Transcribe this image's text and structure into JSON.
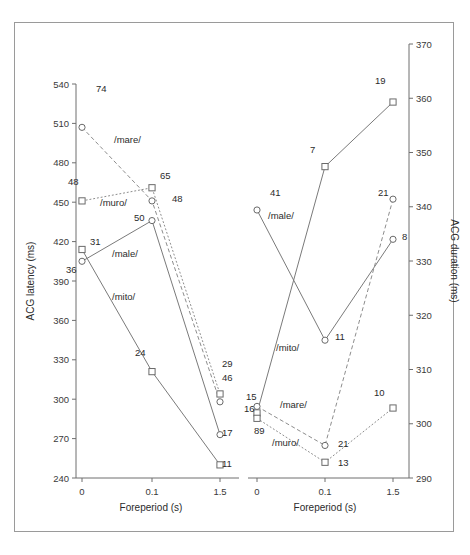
{
  "figure": {
    "background": "#ffffff",
    "frame_color": "#9a9a9a",
    "line_color": "#7a7a7a",
    "marker_edge_color": "#6a6a6a"
  },
  "chart_data": [
    {
      "type": "line",
      "panel": "left",
      "title": "",
      "xlabel": "Foreperiod (s)",
      "ylabel": "ACG latency (ms)",
      "categories": [
        "0",
        "0.1",
        "1.5"
      ],
      "x": [
        0,
        0.1,
        1.5
      ],
      "xtick_labels": [
        "0",
        "0.1",
        "1.5"
      ],
      "ytick_labels": [
        "240",
        "270",
        "300",
        "330",
        "360",
        "390",
        "420",
        "450",
        "480",
        "510",
        "540"
      ],
      "ylim": [
        240,
        540
      ],
      "ytick_step": 30,
      "grid": false,
      "legend": "inline-annotations",
      "series": [
        {
          "name": "/mare/",
          "marker": "circle",
          "linestyle": "dashed",
          "values": [
            507,
            451,
            298
          ],
          "point_labels": [
            "74",
            "48",
            "46"
          ]
        },
        {
          "name": "/muro/",
          "marker": "square",
          "linestyle": "dotted",
          "values": [
            451,
            461,
            304
          ],
          "point_labels": [
            "48",
            "65",
            "29"
          ]
        },
        {
          "name": "/male/",
          "marker": "circle",
          "linestyle": "solid",
          "values": [
            405,
            436,
            273
          ],
          "point_labels": [
            "36",
            "50",
            "17"
          ]
        },
        {
          "name": "/mito/",
          "marker": "square",
          "linestyle": "solid",
          "values": [
            414,
            321,
            250
          ],
          "point_labels": [
            "31",
            "24",
            "11"
          ]
        }
      ]
    },
    {
      "type": "line",
      "panel": "right",
      "title": "",
      "xlabel": "Foreperiod (s)",
      "ylabel": "ACG duration (ms)",
      "categories": [
        "0",
        "0.1",
        "1.5"
      ],
      "x": [
        0,
        0.1,
        1.5
      ],
      "xtick_labels": [
        "0",
        "0.1",
        "1.5"
      ],
      "ytick_labels": [
        "290",
        "300",
        "310",
        "320",
        "330",
        "340",
        "350",
        "360",
        "370"
      ],
      "ylim": [
        290,
        370
      ],
      "ytick_step": 10,
      "grid": false,
      "legend": "inline-annotations",
      "series": [
        {
          "name": "/male/",
          "marker": "circle",
          "linestyle": "solid",
          "values": [
            339.4,
            315.4,
            334.0
          ],
          "point_labels": [
            "41",
            "11",
            "8"
          ]
        },
        {
          "name": "/mito/",
          "marker": "square",
          "linestyle": "solid",
          "values": [
            302.0,
            347.4,
            359.3
          ],
          "point_labels": [
            "15",
            "7",
            "19"
          ]
        },
        {
          "name": "/mare/",
          "marker": "circle",
          "linestyle": "dashed",
          "values": [
            303.2,
            296.0,
            341.4
          ],
          "point_labels": [
            "16",
            "21",
            "21"
          ]
        },
        {
          "name": "/muro/",
          "marker": "square",
          "linestyle": "dotted",
          "values": [
            301.0,
            292.9,
            302.9
          ],
          "point_labels": [
            "89",
            "13",
            "10"
          ]
        }
      ]
    }
  ],
  "left_panel": {
    "ylabel": "ACG latency (ms)",
    "xlabel": "Foreperiod (s)",
    "yticks": [
      "540",
      "510",
      "480",
      "450",
      "420",
      "390",
      "360",
      "330",
      "300",
      "270",
      "240"
    ],
    "xticks": [
      "0",
      "0.1",
      "1.5"
    ],
    "annotations": [
      {
        "text": "74",
        "x": 96,
        "y": 92
      },
      {
        "text": "/mare/",
        "x": 114,
        "y": 143
      },
      {
        "text": "48",
        "x": 68,
        "y": 185
      },
      {
        "text": "/muro/",
        "x": 100,
        "y": 206
      },
      {
        "text": "65",
        "x": 160,
        "y": 179
      },
      {
        "text": "48",
        "x": 172,
        "y": 202
      },
      {
        "text": "50",
        "x": 134,
        "y": 221
      },
      {
        "text": "31",
        "x": 90,
        "y": 245
      },
      {
        "text": "/male/",
        "x": 112,
        "y": 257
      },
      {
        "text": "36",
        "x": 66,
        "y": 273
      },
      {
        "text": "/mito/",
        "x": 112,
        "y": 300
      },
      {
        "text": "24",
        "x": 135,
        "y": 356
      },
      {
        "text": "29",
        "x": 222,
        "y": 367
      },
      {
        "text": "46",
        "x": 222,
        "y": 381
      },
      {
        "text": "17",
        "x": 222,
        "y": 436
      },
      {
        "text": "11",
        "x": 222,
        "y": 467
      }
    ]
  },
  "right_panel": {
    "ylabel": "ACG duration (ms)",
    "xlabel": "Foreperiod (s)",
    "yticks": [
      "370",
      "360",
      "350",
      "340",
      "330",
      "320",
      "310",
      "300",
      "290"
    ],
    "xticks": [
      "0",
      "0.1",
      "1.5"
    ],
    "annotations": [
      {
        "text": "19",
        "x": 375,
        "y": 84
      },
      {
        "text": "7",
        "x": 310,
        "y": 153
      },
      {
        "text": "41",
        "x": 270,
        "y": 196
      },
      {
        "text": "/male/",
        "x": 268,
        "y": 219
      },
      {
        "text": "21",
        "x": 378,
        "y": 196
      },
      {
        "text": "8",
        "x": 402,
        "y": 240
      },
      {
        "text": "11",
        "x": 335,
        "y": 340
      },
      {
        "text": "/mito/",
        "x": 276,
        "y": 351
      },
      {
        "text": "15",
        "x": 246,
        "y": 400
      },
      {
        "text": "/mare/",
        "x": 280,
        "y": 408
      },
      {
        "text": "16",
        "x": 244,
        "y": 412
      },
      {
        "text": "89",
        "x": 254,
        "y": 434
      },
      {
        "text": "/muro/",
        "x": 272,
        "y": 446
      },
      {
        "text": "21",
        "x": 338,
        "y": 447
      },
      {
        "text": "13",
        "x": 338,
        "y": 466
      },
      {
        "text": "10",
        "x": 374,
        "y": 396
      }
    ]
  }
}
